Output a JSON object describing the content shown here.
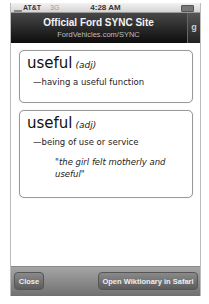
{
  "status_bar": {
    "carrier": "AT&T",
    "network": "3G",
    "time": "4:28 AM",
    "signal_icon": "signal-bars-icon",
    "battery_icon": "battery-icon"
  },
  "nav_bar": {
    "title": "Official Ford SYNC Site",
    "subtitle": "FordVehicles.com/SYNC",
    "side_label": "g"
  },
  "definitions": [
    {
      "word": "useful",
      "part_of_speech": "(adj)",
      "definition": "—having a useful function"
    },
    {
      "word": "useful",
      "part_of_speech": "(adj)",
      "definition": "—being of use or service",
      "example": "\"the girl felt motherly and useful\""
    }
  ],
  "toolbar": {
    "close_label": "Close",
    "open_label": "Open Wiktionary in Safari"
  }
}
